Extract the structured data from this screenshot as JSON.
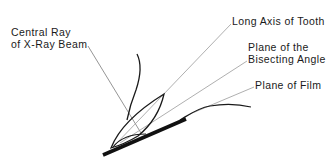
{
  "diagram": {
    "labels": {
      "central_ray_line1": "Central Ray",
      "central_ray_line2": "of X-Ray Beam",
      "long_axis": "Long Axis of Tooth",
      "bisecting_line1": "Plane of the",
      "bisecting_line2": "Bisecting Angle",
      "film": "Plane of Film"
    },
    "colors": {
      "ink": "#1a1a1a",
      "leader": "#8a8a8a",
      "background": "#ffffff"
    }
  }
}
